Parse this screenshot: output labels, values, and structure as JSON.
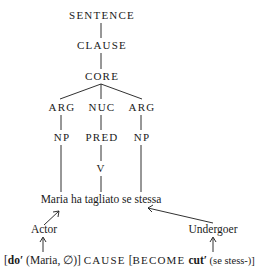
{
  "tree": {
    "root": "SENTENCE",
    "clause": "CLAUSE",
    "core": "CORE",
    "core_children": [
      "ARG",
      "NUC",
      "ARG"
    ],
    "second_level": [
      "NP",
      "PRED",
      "NP"
    ],
    "verb": "V"
  },
  "sentence": "Maria ha tagliato se stessa",
  "roles": {
    "actor": "Actor",
    "undergoer": "Undergoer"
  },
  "logical_structure": {
    "open1": "[",
    "pred1": "do′",
    "args1": " (Maria, ∅)] ",
    "cause": "CAUSE",
    "open2": " [",
    "become": "BECOME",
    "pred2": " cut′",
    "args2": " (se stess-)]"
  }
}
